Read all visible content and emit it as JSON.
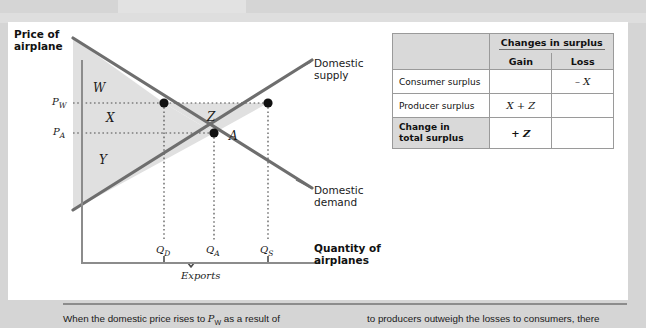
{
  "figure": {
    "y_axis_title": "Price of airplane",
    "x_axis_title": "Quantity of airplanes",
    "price_labels": [
      {
        "id": "PW",
        "base": "P",
        "sub": "W"
      },
      {
        "id": "PA",
        "base": "P",
        "sub": "A"
      }
    ],
    "quantity_labels": [
      {
        "id": "QD",
        "base": "Q",
        "sub": "D"
      },
      {
        "id": "QA",
        "base": "Q",
        "sub": "A"
      },
      {
        "id": "QS",
        "base": "Q",
        "sub": "S"
      }
    ],
    "curve_labels": {
      "supply_line1": "Domestic",
      "supply_line2": "supply",
      "demand_line1": "Domestic",
      "demand_line2": "demand"
    },
    "region_labels": {
      "w": "W",
      "x": "X",
      "y": "Y",
      "z": "Z",
      "a": "A"
    },
    "bracket_label": "Exports"
  },
  "table": {
    "header_blank": "",
    "header_span": "Changes in surplus",
    "col_gain": "Gain",
    "col_loss": "Loss",
    "rows": [
      {
        "label": "Consumer surplus",
        "gain": "",
        "loss": "– X"
      },
      {
        "label": "Producer surplus",
        "gain": "X + Z",
        "loss": ""
      }
    ],
    "total_row": {
      "label_line1": "Change in",
      "label_line2": "total surplus",
      "gain": "+ Z",
      "loss": ""
    }
  },
  "caption": {
    "left_pre": "When the domestic price rises to ",
    "left_sym": "P",
    "left_sub": "W",
    "left_post": " as a result of",
    "right": "to producers outweigh the losses to consumers, there"
  },
  "colors": {
    "page_background": "#d5d5d5",
    "panel_background": "#ffffff",
    "curve": "#6e6e6e",
    "axis": "#8c8c8c",
    "shade": "#e0e0e0",
    "table_header": "#d9d9d9",
    "text": "#1a1a1a"
  }
}
